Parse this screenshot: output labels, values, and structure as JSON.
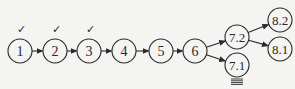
{
  "diagram": {
    "colors": {
      "stroke": "#2a2a2a",
      "background": "#f4f4f2"
    },
    "nodes": [
      {
        "id": "1",
        "label": "1",
        "cx": 20,
        "cy": 51,
        "checked": true,
        "grounded": false
      },
      {
        "id": "2",
        "label": "2",
        "cx": 55,
        "cy": 51,
        "checked": true,
        "grounded": false
      },
      {
        "id": "3",
        "label": "3",
        "cx": 89,
        "cy": 51,
        "checked": true,
        "grounded": false
      },
      {
        "id": "4",
        "label": "4",
        "cx": 124,
        "cy": 51,
        "checked": false,
        "grounded": false
      },
      {
        "id": "5",
        "label": "5",
        "cx": 161,
        "cy": 51,
        "checked": false,
        "grounded": false
      },
      {
        "id": "6",
        "label": "6",
        "cx": 195,
        "cy": 51,
        "checked": false,
        "grounded": false
      },
      {
        "id": "7.2",
        "label": "7.2",
        "cx": 237,
        "cy": 37,
        "checked": false,
        "grounded": false
      },
      {
        "id": "7.1",
        "label": "7.1",
        "cx": 237,
        "cy": 65,
        "checked": false,
        "grounded": true
      },
      {
        "id": "8.2",
        "label": "8.2",
        "cx": 280,
        "cy": 20,
        "checked": false,
        "grounded": false
      },
      {
        "id": "8.1",
        "label": "8.1",
        "cx": 280,
        "cy": 49,
        "checked": false,
        "grounded": false
      }
    ],
    "edges": [
      {
        "from": "1",
        "to": "2"
      },
      {
        "from": "2",
        "to": "3"
      },
      {
        "from": "3",
        "to": "4"
      },
      {
        "from": "4",
        "to": "5"
      },
      {
        "from": "5",
        "to": "6"
      },
      {
        "from": "6",
        "to": "7.2"
      },
      {
        "from": "6",
        "to": "7.1"
      },
      {
        "from": "7.2",
        "to": "8.2"
      },
      {
        "from": "7.2",
        "to": "8.1"
      }
    ],
    "check_symbol": "✓",
    "node_radius": 12
  }
}
